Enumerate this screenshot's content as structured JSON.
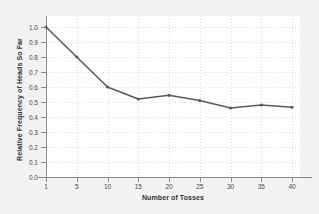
{
  "chart_data": {
    "type": "line",
    "title": "",
    "xlabel": "Number of Tosses",
    "ylabel": "Relative Frequency of Heads So Far",
    "categories": [
      1,
      5,
      10,
      15,
      20,
      25,
      30,
      35,
      40
    ],
    "x_tick_labels": [
      "1",
      "5",
      "10",
      "15",
      "20",
      "25",
      "30",
      "35",
      "40"
    ],
    "values": [
      1.0,
      0.8,
      0.6,
      0.52,
      0.545,
      0.51,
      0.46,
      0.48,
      0.465
    ],
    "y_tick_labels": [
      "0.0",
      "0.1",
      "0.2",
      "0.3",
      "0.4",
      "0.5",
      "0.6",
      "0.7",
      "0.8",
      "0.9",
      "1.0"
    ],
    "y_ticks": [
      0.0,
      0.1,
      0.2,
      0.3,
      0.4,
      0.5,
      0.6,
      0.7,
      0.8,
      0.9,
      1.0
    ],
    "ylim": [
      0.0,
      1.0
    ],
    "grid": true,
    "legend": false,
    "series_color": "#595959",
    "marker": "dot",
    "background_color": "#f2f2f2",
    "plot_background_color": "#ffffff",
    "gridline_color": "#d8d8d8",
    "axis_color": "#8a8a8a"
  }
}
